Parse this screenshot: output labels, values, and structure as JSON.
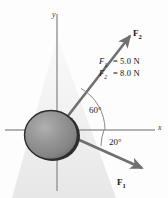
{
  "figure": {
    "axes": {
      "x_label": "x",
      "y_label": "y"
    },
    "object": {
      "name": "sphere",
      "fill_color": "#8d8d8d",
      "edge_color": "#2a2a2a"
    },
    "vectors": [
      {
        "name": "F2",
        "label": "F",
        "subscript": "2",
        "angle_deg": 60,
        "direction": "up-right",
        "magnitude": "8.0 N"
      },
      {
        "name": "F1",
        "label": "F",
        "subscript": "1",
        "angle_deg": -20,
        "direction": "down-right",
        "magnitude": "5.0 N"
      }
    ],
    "angles": [
      {
        "name": "angle-60",
        "text": "60°"
      },
      {
        "name": "angle-20",
        "text": "20°"
      }
    ],
    "legend": [
      {
        "symbol": "F",
        "subscript": "1",
        "equals": "=",
        "value": "5.0 N"
      },
      {
        "symbol": "F",
        "subscript": "2",
        "equals": "=",
        "value": "8.0 N"
      }
    ],
    "colors": {
      "axis": "#9a9a9a",
      "vector": "#6f6f6f",
      "arc": "#8a8a8a",
      "shadow": "#ececec"
    }
  }
}
